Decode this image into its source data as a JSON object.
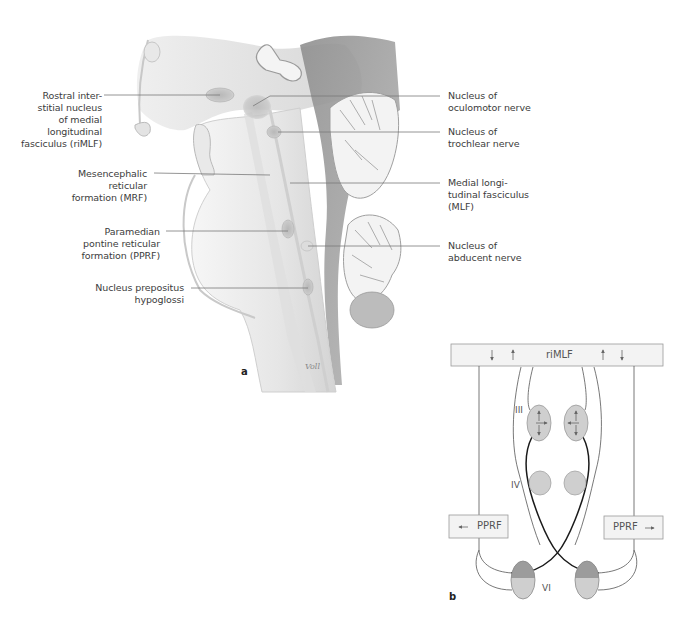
{
  "panel_a": {
    "letter": "a",
    "signature": "Voll",
    "labels_left": [
      {
        "id": "rimlf",
        "lines": [
          "Rostral inter-",
          "stitial nucleus",
          "of medial",
          "longitudinal",
          "fasciculus (riMLF)"
        ]
      },
      {
        "id": "mrf",
        "lines": [
          "Mesencephalic",
          "reticular",
          "formation (MRF)"
        ]
      },
      {
        "id": "pprf",
        "lines": [
          "Paramedian",
          "pontine reticular",
          "formation (PPRF)"
        ]
      },
      {
        "id": "nph",
        "lines": [
          "Nucleus prepositus",
          "hypoglossi"
        ]
      }
    ],
    "labels_right": [
      {
        "id": "oculomotor",
        "lines": [
          "Nucleus of",
          "oculomotor nerve"
        ]
      },
      {
        "id": "trochlear",
        "lines": [
          "Nucleus of",
          "trochlear nerve"
        ]
      },
      {
        "id": "mlf",
        "lines": [
          "Medial longi-",
          "tudinal fasciculus",
          "(MLF)"
        ]
      },
      {
        "id": "abducent",
        "lines": [
          "Nucleus of",
          "abducent nerve"
        ]
      }
    ]
  },
  "panel_b": {
    "letter": "b",
    "rimlf_label": "riMLF",
    "pprf_left_label": "PPRF",
    "pprf_right_label": "PPRF",
    "nucleus_labels": {
      "III": "III",
      "IV": "IV",
      "VI": "VI"
    },
    "colors": {
      "box_fill": "#f3f3f3",
      "box_stroke": "#9a9a9a",
      "nucleus_fill": "#cfcfcf",
      "nucleus_dark": "#9c9c9c",
      "line_thin": "#555555",
      "line_thick": "#1a1a1a"
    }
  }
}
